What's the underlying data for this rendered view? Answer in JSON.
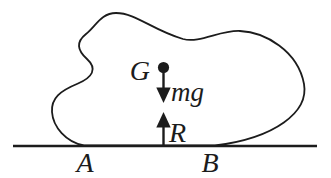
{
  "figure": {
    "kind": "free-body-diagram",
    "labels": {
      "center_of_gravity": "G",
      "weight_force": "mg",
      "normal_reaction": "R",
      "contact_point_left": "A",
      "contact_point_right": "B"
    },
    "colors": {
      "ink": "#1c1c1c",
      "background": "#ffffff"
    }
  }
}
